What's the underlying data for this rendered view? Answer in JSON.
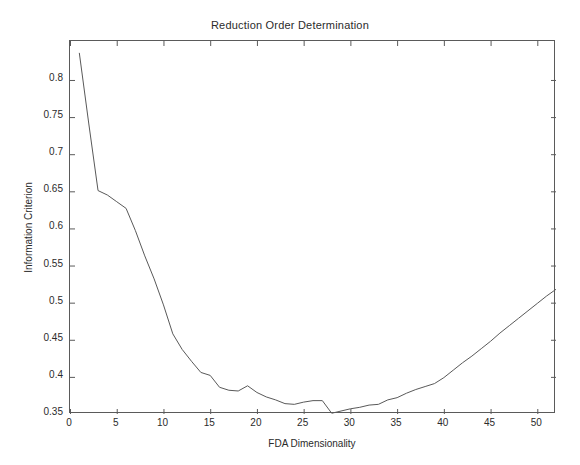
{
  "chart_data": {
    "type": "line",
    "title": "Reduction Order Determination",
    "xlabel": "FDA Dimensionality",
    "ylabel": "Information Criterion",
    "xlim": [
      0,
      52
    ],
    "ylim": [
      0.35,
      0.8525
    ],
    "grid": false,
    "legend": null,
    "xticks": [
      0,
      5,
      10,
      15,
      20,
      25,
      30,
      35,
      40,
      45,
      50
    ],
    "xtick_labels": [
      "0",
      "5",
      "10",
      "15",
      "20",
      "25",
      "30",
      "35",
      "40",
      "45",
      "50"
    ],
    "yticks": [
      0.35,
      0.4,
      0.45,
      0.5,
      0.55,
      0.6,
      0.65,
      0.7,
      0.75,
      0.8
    ],
    "ytick_labels": [
      "0.35",
      "0.4",
      "0.45",
      "0.5",
      "0.55",
      "0.6",
      "0.65",
      "0.7",
      "0.75",
      "0.8"
    ],
    "line_color": "#595959",
    "line_width": 1,
    "series": [
      {
        "name": "Information Criterion",
        "x": [
          1,
          2,
          3,
          4,
          5,
          6,
          7,
          8,
          9,
          10,
          11,
          12,
          13,
          14,
          15,
          16,
          17,
          18,
          19,
          20,
          21,
          22,
          23,
          24,
          25,
          26,
          27,
          28,
          29,
          30,
          31,
          32,
          33,
          34,
          35,
          36,
          37,
          38,
          39,
          40,
          41,
          42,
          43,
          44,
          45,
          46,
          47,
          48,
          49,
          50,
          51,
          52
        ],
        "values": [
          0.836,
          0.742,
          0.651,
          0.645,
          0.636,
          0.627,
          0.597,
          0.563,
          0.532,
          0.497,
          0.458,
          0.437,
          0.421,
          0.406,
          0.402,
          0.386,
          0.382,
          0.381,
          0.388,
          0.379,
          0.373,
          0.369,
          0.364,
          0.363,
          0.366,
          0.368,
          0.368,
          0.351,
          0.354,
          0.357,
          0.359,
          0.362,
          0.363,
          0.369,
          0.372,
          0.378,
          0.383,
          0.387,
          0.391,
          0.399,
          0.409,
          0.419,
          0.428,
          0.438,
          0.448,
          0.459,
          0.469,
          0.479,
          0.489,
          0.499,
          0.509,
          0.518
        ],
        "annotations": [
          "steep monotone decline from x=1 to roughly x=14",
          "shallow bumpy plateau between x=14 and x=27",
          "global minimum 0.35 at x=26",
          "steady near-linear rise from x=29 to x=52"
        ]
      }
    ]
  }
}
